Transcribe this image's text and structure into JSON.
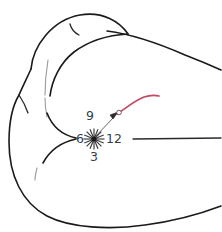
{
  "figure": {
    "background_color": "#ffffff",
    "outline_color": "#1a1a1a",
    "faint_color": "#9a9a9a",
    "accent_color": "#c04a63",
    "marker_color": "#3a3a3a",
    "label_color": "#3c3c3c"
  },
  "clock_labels": {
    "twelve": "12",
    "three": "3",
    "six": "6",
    "nine": "9"
  },
  "annotations": {
    "burst_marker_name": "starburst-point-marker",
    "pointer_name": "arrow-pointer",
    "accent_curve_name": "red-annotation-curve"
  }
}
